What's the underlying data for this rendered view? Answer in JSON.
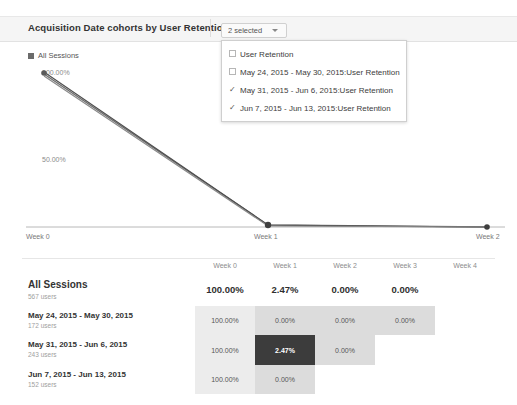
{
  "header": {
    "title": "Acquisition Date cohorts by User Retention"
  },
  "metric_select": {
    "button_label": "2 selected",
    "caret_icon": "chevron-down-icon",
    "options": [
      {
        "label": "User Retention",
        "checked": false
      },
      {
        "label": "May 24, 2015 - May 30, 2015:User Retention",
        "checked": false
      },
      {
        "label": "May 31, 2015 - Jun 6, 2015:User Retention",
        "checked": true
      },
      {
        "label": "Jun 7, 2015 - Jun 13, 2015:User Retention",
        "checked": true
      }
    ]
  },
  "chart": {
    "legend_label": "All Sessions",
    "legend_color": "#6b6b6b"
  },
  "chart_data": {
    "type": "line",
    "title": "Acquisition Date cohorts by User Retention",
    "xlabel": "",
    "ylabel": "",
    "x": [
      "Week 0",
      "Week 1",
      "Week 2"
    ],
    "ytick_labels": [
      "100.00%",
      "50.00%"
    ],
    "ytick_values": [
      100,
      50
    ],
    "ylim": [
      0,
      100
    ],
    "grid": false,
    "legend_position": "top-left",
    "series": [
      {
        "name": "All Sessions",
        "values": [
          100.0,
          2.47,
          0.0
        ],
        "color": "#6b6b6b"
      },
      {
        "name": "May 31, 2015 - Jun 6, 2015:User Retention",
        "values": [
          100.0,
          2.47,
          0.0
        ],
        "color": "#595959"
      },
      {
        "name": "Jun 7, 2015 - Jun 13, 2015:User Retention",
        "values": [
          100.0,
          0.0,
          0.0
        ],
        "color": "#777777"
      }
    ]
  },
  "table": {
    "columns": [
      "",
      "Week 0",
      "Week 1",
      "Week 2",
      "Week 3",
      "Week 4"
    ],
    "rows": [
      {
        "name": "All Sessions",
        "users": "567 users",
        "is_total": true,
        "cells": [
          {
            "value": "100.00%",
            "shade": "none"
          },
          {
            "value": "2.47%",
            "shade": "none"
          },
          {
            "value": "0.00%",
            "shade": "none"
          },
          {
            "value": "0.00%",
            "shade": "none"
          },
          {
            "value": "",
            "shade": "empty"
          }
        ]
      },
      {
        "name": "May 24, 2015 - May 30, 2015",
        "users": "172 users",
        "is_total": false,
        "cells": [
          {
            "value": "100.00%",
            "shade": "#ececec"
          },
          {
            "value": "0.00%",
            "shade": "#dcdcdc"
          },
          {
            "value": "0.00%",
            "shade": "#dcdcdc"
          },
          {
            "value": "0.00%",
            "shade": "#dcdcdc"
          },
          {
            "value": "",
            "shade": "empty"
          }
        ]
      },
      {
        "name": "May 31, 2015 - Jun 6, 2015",
        "users": "243 users",
        "is_total": false,
        "cells": [
          {
            "value": "100.00%",
            "shade": "#ececec"
          },
          {
            "value": "2.47%",
            "shade": "dark"
          },
          {
            "value": "0.00%",
            "shade": "#dcdcdc"
          },
          {
            "value": "",
            "shade": "empty"
          },
          {
            "value": "",
            "shade": "empty"
          }
        ]
      },
      {
        "name": "Jun 7, 2015 - Jun 13, 2015",
        "users": "152 users",
        "is_total": false,
        "cells": [
          {
            "value": "100.00%",
            "shade": "#ececec"
          },
          {
            "value": "0.00%",
            "shade": "#dcdcdc"
          },
          {
            "value": "",
            "shade": "empty"
          },
          {
            "value": "",
            "shade": "empty"
          },
          {
            "value": "",
            "shade": "empty"
          }
        ]
      }
    ]
  }
}
